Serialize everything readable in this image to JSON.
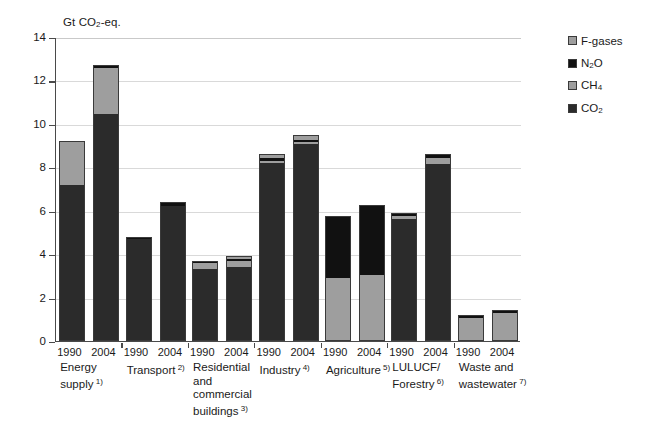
{
  "chart_data": {
    "type": "bar",
    "stacked": true,
    "title": "",
    "ylabel": "Gt CO2-eq.",
    "xlabel": "",
    "ylim": [
      0,
      14
    ],
    "yticks": [
      0,
      2,
      4,
      6,
      8,
      10,
      12,
      14
    ],
    "grid": true,
    "legend_position": "right",
    "legend": [
      "F-gases",
      "N2O",
      "CH4",
      "CO2"
    ],
    "series": [
      {
        "name": "CO2",
        "color": "#2b2b2b"
      },
      {
        "name": "CH4",
        "color": "#9e9e9e"
      },
      {
        "name": "N2O",
        "color": "#111111"
      },
      {
        "name": "F-gases",
        "color": "#9e9e9e"
      }
    ],
    "sectors": [
      {
        "name": "Energy supply",
        "footnote": "1)",
        "name_lines": [
          "Energy",
          "supply"
        ],
        "years": [
          {
            "year": "1990",
            "total": 9.2,
            "segments": {
              "CO2": 7.2,
              "CH4": 2.0,
              "N2O": 0.0,
              "F-gases": 0.0
            }
          },
          {
            "year": "2004",
            "total": 12.7,
            "segments": {
              "CO2": 10.5,
              "CH4": 2.1,
              "N2O": 0.1,
              "F-gases": 0.0
            }
          }
        ]
      },
      {
        "name": "Transport",
        "footnote": "2)",
        "name_lines": [
          "Transport"
        ],
        "years": [
          {
            "year": "1990",
            "total": 4.8,
            "segments": {
              "CO2": 4.75,
              "CH4": 0.0,
              "N2O": 0.05,
              "F-gases": 0.0
            }
          },
          {
            "year": "2004",
            "total": 6.4,
            "segments": {
              "CO2": 6.25,
              "CH4": 0.0,
              "N2O": 0.15,
              "F-gases": 0.0
            }
          }
        ]
      },
      {
        "name": "Residential and commercial buildings",
        "footnote": "3)",
        "name_lines": [
          "Residential",
          "and",
          "commercial",
          "buildings"
        ],
        "years": [
          {
            "year": "1990",
            "total": 3.7,
            "segments": {
              "CO2": 3.35,
              "CH4": 0.3,
              "N2O": 0.05,
              "F-gases": 0.0
            }
          },
          {
            "year": "2004",
            "total": 3.9,
            "segments": {
              "CO2": 3.45,
              "CH4": 0.3,
              "N2O": 0.05,
              "F-gases": 0.1
            }
          }
        ]
      },
      {
        "name": "Industry",
        "footnote": "4)",
        "name_lines": [
          "Industry"
        ],
        "years": [
          {
            "year": "1990",
            "total": 8.6,
            "segments": {
              "CO2": 8.25,
              "CH4": 0.1,
              "N2O": 0.1,
              "F-gases": 0.15
            }
          },
          {
            "year": "2004",
            "total": 9.5,
            "segments": {
              "CO2": 9.1,
              "CH4": 0.1,
              "N2O": 0.1,
              "F-gases": 0.2
            }
          }
        ]
      },
      {
        "name": "Agriculture",
        "footnote": "5)",
        "name_lines": [
          "Agriculture"
        ],
        "years": [
          {
            "year": "1990",
            "total": 5.75,
            "segments": {
              "CO2": 0.0,
              "CH4": 2.9,
              "N2O": 2.85,
              "F-gases": 0.0
            }
          },
          {
            "year": "2004",
            "total": 6.25,
            "segments": {
              "CO2": 0.0,
              "CH4": 3.05,
              "N2O": 3.2,
              "F-gases": 0.0
            }
          }
        ]
      },
      {
        "name": "LULUCF/ Forestry",
        "footnote": "6)",
        "name_lines": [
          "LULUCF/",
          "Forestry"
        ],
        "years": [
          {
            "year": "1990",
            "total": 5.9,
            "segments": {
              "CO2": 5.65,
              "CH4": 0.15,
              "N2O": 0.1,
              "F-gases": 0.0
            }
          },
          {
            "year": "2004",
            "total": 8.6,
            "segments": {
              "CO2": 8.2,
              "CH4": 0.25,
              "N2O": 0.15,
              "F-gases": 0.0
            }
          }
        ]
      },
      {
        "name": "Waste and wastewater",
        "footnote": "7)",
        "name_lines": [
          "Waste and",
          "wastewater"
        ],
        "years": [
          {
            "year": "1990",
            "total": 1.2,
            "segments": {
              "CO2": 0.0,
              "CH4": 1.12,
              "N2O": 0.08,
              "F-gases": 0.0
            }
          },
          {
            "year": "2004",
            "total": 1.43,
            "segments": {
              "CO2": 0.0,
              "CH4": 1.33,
              "N2O": 0.1,
              "F-gases": 0.0
            }
          }
        ]
      }
    ]
  },
  "axis": {
    "y_title_prefix": "Gt CO",
    "y_title_sub": "2",
    "y_title_suffix": "-eq.",
    "tick_labels": [
      "14",
      "12",
      "10",
      "8",
      "6",
      "4",
      "2",
      "0"
    ]
  },
  "legend": {
    "items": [
      {
        "id": "fgases",
        "label": "F-gases",
        "sub": "",
        "tail": "",
        "color": "#9e9e9e"
      },
      {
        "id": "n2o",
        "label": "N",
        "sub": "2",
        "tail": "O",
        "color": "#111111"
      },
      {
        "id": "ch4",
        "label": "CH",
        "sub": "4",
        "tail": "",
        "color": "#9e9e9e"
      },
      {
        "id": "co2",
        "label": "CO",
        "sub": "2",
        "tail": "",
        "color": "#2b2b2b"
      }
    ]
  }
}
